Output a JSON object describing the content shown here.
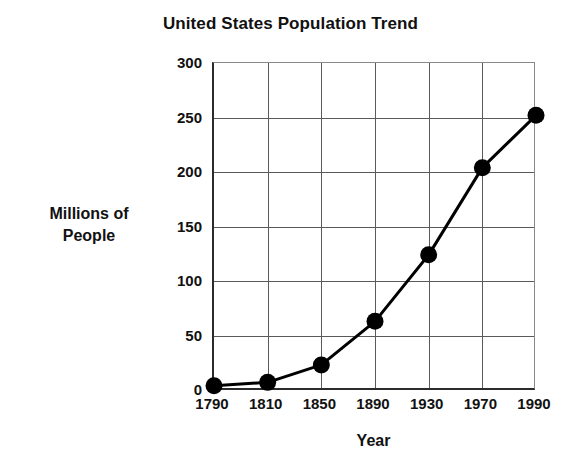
{
  "chart_data": {
    "type": "line",
    "title": "United States Population Trend",
    "xlabel": "Year",
    "ylabel": "Millions of\nPeople",
    "ylabel_line1": "Millions of",
    "ylabel_line2": "People",
    "categories": [
      "1790",
      "1810",
      "1850",
      "1890",
      "1930",
      "1970",
      "1990"
    ],
    "values": [
      4,
      7,
      23,
      63,
      124,
      204,
      252
    ],
    "ylim": [
      0,
      300
    ],
    "yticks": [
      0,
      50,
      100,
      150,
      200,
      250,
      300
    ],
    "ytick_labels": [
      "0",
      "50",
      "100",
      "150",
      "200",
      "250",
      "300"
    ],
    "grid": true,
    "grid_axis": "both",
    "legend": false,
    "marker": "circle",
    "marker_color": "#000000",
    "line_color": "#000000",
    "background_color": "#ffffff",
    "axis_color": "#2b2b2b",
    "gridline_color": "#5a5a5a"
  }
}
